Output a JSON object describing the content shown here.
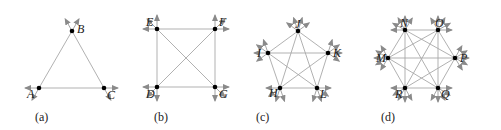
{
  "colors": {
    "line": "#a8a8a8",
    "arrow": "#8a8a8a",
    "vertex": "#000000",
    "text": "#222222"
  },
  "panels": [
    {
      "id": "a",
      "caption": "(a)",
      "caption_pos": [
        35,
        121
      ],
      "vertices": [
        {
          "name": "A",
          "x": 39,
          "y": 88,
          "lx": -12,
          "ly": 10
        },
        {
          "name": "B",
          "x": 72,
          "y": 31,
          "lx": 5,
          "ly": 2
        },
        {
          "name": "C",
          "x": 104,
          "y": 88,
          "lx": 3,
          "ly": 11
        }
      ],
      "edges": [
        [
          "A",
          "B"
        ],
        [
          "B",
          "C"
        ],
        [
          "A",
          "C"
        ]
      ]
    },
    {
      "id": "b",
      "caption": "(b)",
      "caption_pos": [
        154,
        121
      ],
      "vertices": [
        {
          "name": "E",
          "x": 157,
          "y": 29,
          "lx": -11,
          "ly": -3
        },
        {
          "name": "F",
          "x": 215,
          "y": 29,
          "lx": 4,
          "ly": -3
        },
        {
          "name": "D",
          "x": 157,
          "y": 87,
          "lx": -11,
          "ly": 11
        },
        {
          "name": "G",
          "x": 215,
          "y": 87,
          "lx": 4,
          "ly": 11
        }
      ],
      "edges": [
        [
          "E",
          "F"
        ],
        [
          "E",
          "D"
        ],
        [
          "F",
          "G"
        ],
        [
          "D",
          "G"
        ],
        [
          "E",
          "G"
        ],
        [
          "F",
          "D"
        ]
      ]
    },
    {
      "id": "c",
      "caption": "(c)",
      "caption_pos": [
        256,
        121
      ],
      "vertices": [
        {
          "name": "J",
          "x": 298,
          "y": 31,
          "lx": -3,
          "ly": -3
        },
        {
          "name": "I",
          "x": 268,
          "y": 53,
          "lx": -11,
          "ly": 4
        },
        {
          "name": "K",
          "x": 328,
          "y": 53,
          "lx": 5,
          "ly": 4
        },
        {
          "name": "H",
          "x": 280,
          "y": 88,
          "lx": -11,
          "ly": 9
        },
        {
          "name": "L",
          "x": 317,
          "y": 88,
          "lx": 3,
          "ly": 10
        }
      ],
      "edges": [
        [
          "J",
          "I"
        ],
        [
          "J",
          "K"
        ],
        [
          "J",
          "H"
        ],
        [
          "J",
          "L"
        ],
        [
          "I",
          "K"
        ],
        [
          "I",
          "H"
        ],
        [
          "I",
          "L"
        ],
        [
          "K",
          "H"
        ],
        [
          "K",
          "L"
        ],
        [
          "H",
          "L"
        ]
      ]
    },
    {
      "id": "d",
      "caption": "(d)",
      "caption_pos": [
        381,
        121
      ],
      "vertices": [
        {
          "name": "N",
          "x": 405,
          "y": 30,
          "lx": -5,
          "ly": -3
        },
        {
          "name": "O",
          "x": 438,
          "y": 30,
          "lx": -3,
          "ly": -3
        },
        {
          "name": "M",
          "x": 388,
          "y": 58,
          "lx": -12,
          "ly": 4
        },
        {
          "name": "P",
          "x": 455,
          "y": 58,
          "lx": 5,
          "ly": 4
        },
        {
          "name": "R",
          "x": 405,
          "y": 88,
          "lx": -10,
          "ly": 10
        },
        {
          "name": "Q",
          "x": 438,
          "y": 88,
          "lx": 3,
          "ly": 10
        }
      ],
      "edges": [
        [
          "N",
          "O"
        ],
        [
          "N",
          "M"
        ],
        [
          "N",
          "P"
        ],
        [
          "N",
          "R"
        ],
        [
          "N",
          "Q"
        ],
        [
          "O",
          "M"
        ],
        [
          "O",
          "P"
        ],
        [
          "O",
          "R"
        ],
        [
          "O",
          "Q"
        ],
        [
          "M",
          "P"
        ],
        [
          "M",
          "R"
        ],
        [
          "M",
          "Q"
        ],
        [
          "P",
          "R"
        ],
        [
          "P",
          "Q"
        ],
        [
          "R",
          "Q"
        ]
      ]
    }
  ]
}
